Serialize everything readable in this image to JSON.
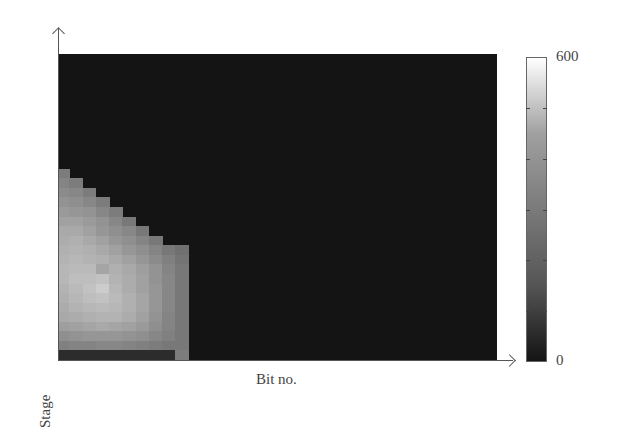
{
  "chart_data": {
    "type": "heatmap",
    "title": "",
    "xlabel": "Bit no.",
    "ylabel": "Stage",
    "x_ticks": [],
    "y_ticks": [],
    "colorbar": {
      "min": 0,
      "max": 600,
      "labels": [
        "600",
        "0"
      ],
      "ticks": [
        0,
        100,
        200,
        300,
        400,
        500,
        600
      ],
      "colormap": "gray"
    },
    "grid": false,
    "n_cols": 33,
    "n_rows": 32,
    "background_value": 10,
    "rows_top_to_bottom_note": "row index 0 = top of plot; only non-background rows listed; each row lists values for columns 0..n",
    "rows": {
      "12": [
        230
      ],
      "13": [
        250,
        230
      ],
      "14": [
        270,
        260,
        230
      ],
      "15": [
        290,
        280,
        260,
        230
      ],
      "16": [
        310,
        300,
        290,
        260,
        230
      ],
      "17": [
        330,
        330,
        310,
        290,
        260,
        220
      ],
      "18": [
        350,
        350,
        330,
        300,
        280,
        260,
        220
      ],
      "19": [
        360,
        370,
        350,
        330,
        300,
        280,
        250,
        220
      ],
      "20": [
        370,
        380,
        370,
        350,
        330,
        300,
        280,
        250,
        220,
        200
      ],
      "21": [
        380,
        390,
        380,
        370,
        350,
        330,
        300,
        270,
        240,
        210
      ],
      "22": [
        390,
        400,
        400,
        340,
        370,
        350,
        320,
        290,
        250,
        220
      ],
      "23": [
        390,
        410,
        410,
        420,
        380,
        360,
        330,
        290,
        260,
        220
      ],
      "24": [
        380,
        400,
        420,
        450,
        390,
        360,
        330,
        300,
        260,
        220
      ],
      "25": [
        370,
        390,
        410,
        420,
        400,
        370,
        340,
        300,
        260,
        220
      ],
      "26": [
        360,
        380,
        390,
        400,
        390,
        370,
        340,
        300,
        260,
        220
      ],
      "27": [
        350,
        360,
        370,
        380,
        380,
        360,
        330,
        290,
        250,
        220
      ],
      "28": [
        320,
        330,
        340,
        350,
        340,
        330,
        310,
        280,
        250,
        220
      ],
      "29": [
        280,
        290,
        300,
        300,
        300,
        290,
        280,
        260,
        240,
        220
      ],
      "30": [
        240,
        250,
        250,
        260,
        260,
        250,
        240,
        230,
        220,
        220
      ],
      "31": [
        40,
        40,
        40,
        40,
        40,
        40,
        40,
        40,
        40,
        230
      ]
    }
  },
  "axes": {
    "x_label": "Bit no.",
    "y_label": "Stage"
  },
  "colorbar_labels": {
    "max": "600",
    "min": "0"
  }
}
